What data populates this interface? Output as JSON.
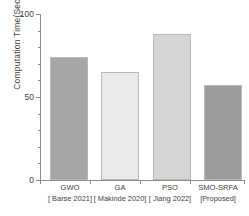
{
  "chart_data": {
    "type": "bar",
    "title": "",
    "xlabel": "",
    "ylabel": "Computation Time(Sec)",
    "categories": [
      "GWO",
      "GA",
      "PSO",
      "SMO-SRFA"
    ],
    "category_sublabels": [
      "[ Barse 2021]",
      "[ Makinde 2020]",
      "[ Jiang 2022]",
      "[Proposed]"
    ],
    "values": [
      74,
      65,
      88,
      57
    ],
    "ylim": [
      0,
      100
    ],
    "yticks": [
      0,
      50,
      100
    ],
    "ytick_labels": [
      "0",
      "50",
      "100"
    ],
    "minor_tick_step": 10,
    "grid": false,
    "legend": false,
    "bar_colors": [
      "#a6a6a6",
      "#e9e9e9",
      "#d5d5d5",
      "#9c9c9c"
    ],
    "bar_border_color": "#b9b9b9",
    "axis_color": "#8d8d8d",
    "background": "#ffffff"
  },
  "axes": {
    "y_title": "Computation Time(Sec)",
    "y_tick_0": "0",
    "y_tick_50": "50",
    "y_tick_100": "100"
  },
  "x_labels": [
    {
      "name": "GWO",
      "citation": "[ Barse 2021]"
    },
    {
      "name": "GA",
      "citation": "[ Makinde 2020]"
    },
    {
      "name": "PSO",
      "citation": "[ Jiang 2022]"
    },
    {
      "name": "SMO-SRFA",
      "citation": "[Proposed]"
    }
  ]
}
